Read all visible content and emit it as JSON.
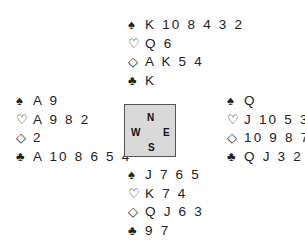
{
  "suits": {
    "spades": "♠",
    "hearts": "♡",
    "diamonds": "◇",
    "clubs": "♣"
  },
  "hands": {
    "north": {
      "spades": "K 10 8 4 3 2",
      "hearts": "Q 6",
      "diamonds": "A K 5 4",
      "clubs": "K"
    },
    "west": {
      "spades": "A 9",
      "hearts": "A 9 8 2",
      "diamonds": "2",
      "clubs": "A 10 8 6 5 4"
    },
    "east": {
      "spades": "Q",
      "hearts": "J 10 5 3",
      "diamonds": "10 9 8 7",
      "clubs": "Q J 3 2"
    },
    "south": {
      "spades": "J 7 6 5",
      "hearts": "K 7 4",
      "diamonds": "Q J 6 3",
      "clubs": "9 7"
    }
  },
  "compass": {
    "n": "N",
    "s": "S",
    "w": "W",
    "e": "E"
  }
}
